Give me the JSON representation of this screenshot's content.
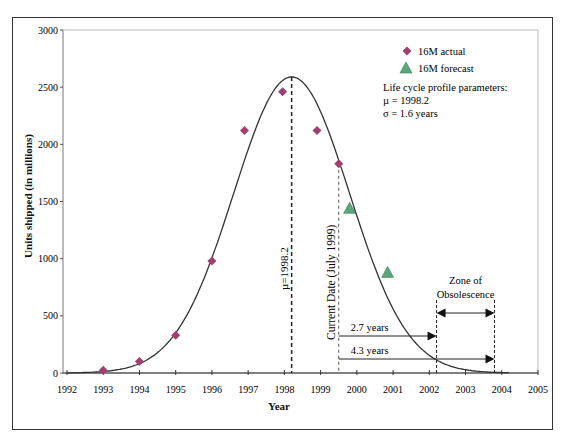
{
  "chart_data": {
    "type": "scatter",
    "title": "",
    "xlabel": "Year",
    "ylabel": "Units shipped (in millions)",
    "xlim": [
      1992,
      2005
    ],
    "ylim": [
      0,
      3000
    ],
    "x_ticks": [
      "1992",
      "1993",
      "1994",
      "1995",
      "1996",
      "1997",
      "1998",
      "1999",
      "2000",
      "2001",
      "2002",
      "2003",
      "2004",
      "2005"
    ],
    "y_ticks": [
      "0",
      "500",
      "1000",
      "1500",
      "2000",
      "2500",
      "3000"
    ],
    "grid": false,
    "legend_position": "upper right",
    "series": [
      {
        "name": "16M actual",
        "marker": "diamond",
        "color": "#a0406e",
        "x": [
          1993.0,
          1994.0,
          1995.0,
          1996.0,
          1996.9,
          1997.95,
          1998.9,
          1999.5
        ],
        "y": [
          25,
          100,
          330,
          980,
          2120,
          2460,
          2120,
          1830
        ]
      },
      {
        "name": "16M forecast",
        "marker": "triangle",
        "color": "#5aa77a",
        "x": [
          1999.8,
          2000.85
        ],
        "y": [
          1440,
          880
        ]
      },
      {
        "name": "Life cycle curve",
        "type": "line",
        "color": "#333333",
        "distribution": "normal",
        "mu": 1998.2,
        "sigma": 1.6,
        "peak": 2590
      }
    ],
    "annotations": {
      "params_title": "Life cycle profile parameters:",
      "mu_text": "µ = 1998.2",
      "sigma_text": "σ = 1.6 years",
      "mu_line_label": "µ=1998.2",
      "mu_line_x": 1998.2,
      "current_date_label": "Current Date (July 1999)",
      "current_date_x": 1999.5,
      "arrow1_label": "2.7 years",
      "arrow1_end_x": 2002.2,
      "arrow2_label": "4.3 years",
      "arrow2_end_x": 2003.8,
      "zone_label_line1": "Zone of",
      "zone_label_line2": "Obsolescence"
    }
  }
}
